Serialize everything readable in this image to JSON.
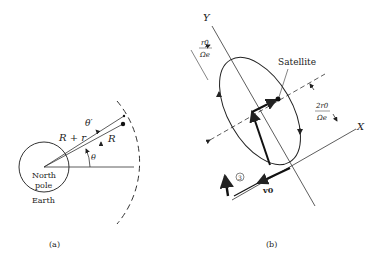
{
  "figure_a": {
    "caption": "(a)",
    "earth_label_line1": "North",
    "earth_label_line2": "pole",
    "earth_name": "Earth",
    "label_R_plus_r": "R + r",
    "label_R": "R",
    "label_theta": "θ",
    "label_theta_prime": "θ′"
  },
  "figure_b": {
    "caption": "(b)",
    "axis_y": "Y",
    "axis_x": "X",
    "satellite_label": "Satellite",
    "width_label_num": "r0",
    "width_label_den": "Ωe",
    "height_label_num": "2r0",
    "height_label_den": "Ωe",
    "velocity_label": "v0",
    "circled_number": "3"
  }
}
